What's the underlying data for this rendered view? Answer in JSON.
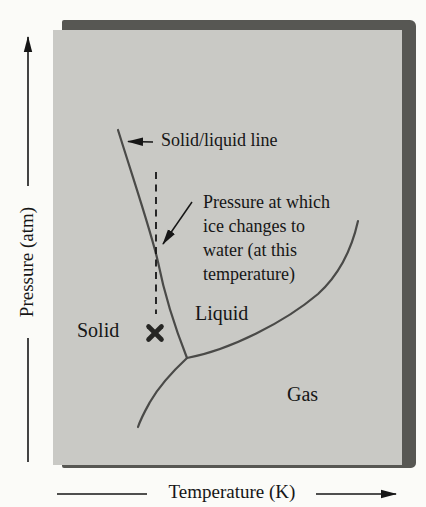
{
  "axes": {
    "y_label": "Pressure (atm)",
    "x_label": "Temperature (K)"
  },
  "regions": {
    "solid": "Solid",
    "liquid": "Liquid",
    "gas": "Gas"
  },
  "callouts": {
    "solid_liquid": "Solid/liquid line",
    "pressure_note": [
      "Pressure at which",
      "ice changes to",
      "water (at this",
      "temperature)"
    ]
  },
  "marker": {
    "name": "x-marker",
    "glyph": "✕"
  },
  "colors": {
    "background": "#fbfbf8",
    "panel": "#c9c9c5",
    "panel_shadow": "#575753",
    "curve": "#4a4a48",
    "ink": "#161616",
    "marker": "#262624"
  }
}
